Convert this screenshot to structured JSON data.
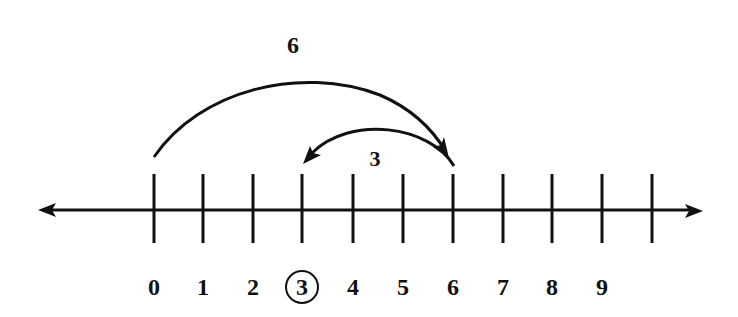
{
  "diagram": {
    "type": "number-line-subtraction",
    "colors": {
      "ink": "#111111",
      "background": "#ffffff"
    },
    "axis": {
      "y": 210,
      "x_start": 38,
      "x_end": 703,
      "arrows": [
        "left",
        "right"
      ]
    },
    "ticks": [
      {
        "value": 0,
        "x": 154,
        "label": "0",
        "circled": false
      },
      {
        "value": 1,
        "x": 203,
        "label": "1",
        "circled": false
      },
      {
        "value": 2,
        "x": 253,
        "label": "2",
        "circled": false
      },
      {
        "value": 3,
        "x": 302,
        "label": "3",
        "circled": true
      },
      {
        "value": 4,
        "x": 353,
        "label": "4",
        "circled": false
      },
      {
        "value": 5,
        "x": 403,
        "label": "5",
        "circled": false
      },
      {
        "value": 6,
        "x": 453,
        "label": "6",
        "circled": false
      },
      {
        "value": 7,
        "x": 503,
        "label": "7",
        "circled": false
      },
      {
        "value": 8,
        "x": 552,
        "label": "8",
        "circled": false
      },
      {
        "value": 9,
        "x": 602,
        "label": "9",
        "circled": false
      },
      {
        "value": 10,
        "x": 652,
        "label": "",
        "circled": false
      }
    ],
    "jumps": [
      {
        "name": "jump-forward",
        "from": 0,
        "to": 6,
        "label": "6"
      },
      {
        "name": "jump-back",
        "from": 6,
        "to": 3,
        "label": "3"
      }
    ],
    "answer": "3"
  }
}
